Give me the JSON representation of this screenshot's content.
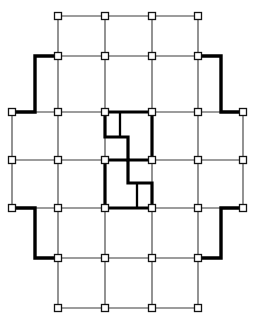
{
  "figure": {
    "type": "architectural-floor-plan",
    "background_color": "#ffffff",
    "line_color": "#3a3a3a",
    "wall_color": "#000000",
    "node_fill": "#ffffff"
  },
  "geometry": {
    "width": 255,
    "height": 326,
    "column_axes_x": [
      12,
      58,
      105,
      152,
      198,
      243
    ],
    "row_axes_y": [
      16,
      56,
      112,
      160,
      208,
      258,
      308
    ],
    "bay_count_x": 5,
    "bay_count_y": 6,
    "node_size": 7
  },
  "grid_lines": {
    "vertical": [
      {
        "id": "axis-A",
        "x": 12,
        "y1": 112,
        "y2": 208
      },
      {
        "id": "axis-B",
        "x": 58,
        "y1": 16,
        "y2": 308
      },
      {
        "id": "axis-C",
        "x": 105,
        "y1": 16,
        "y2": 308
      },
      {
        "id": "axis-D",
        "x": 152,
        "y1": 16,
        "y2": 308
      },
      {
        "id": "axis-E",
        "x": 198,
        "y1": 16,
        "y2": 308
      },
      {
        "id": "axis-F",
        "x": 243,
        "y1": 112,
        "y2": 208
      }
    ],
    "horizontal": [
      {
        "id": "axis-1",
        "y": 16,
        "x1": 58,
        "x2": 198
      },
      {
        "id": "axis-2",
        "y": 56,
        "x1": 58,
        "x2": 198
      },
      {
        "id": "axis-3",
        "y": 112,
        "x1": 12,
        "x2": 243
      },
      {
        "id": "axis-4",
        "y": 160,
        "x1": 12,
        "x2": 243
      },
      {
        "id": "axis-5",
        "y": 208,
        "x1": 12,
        "x2": 243
      },
      {
        "id": "axis-6",
        "y": 258,
        "x1": 58,
        "x2": 198
      },
      {
        "id": "axis-7",
        "y": 308,
        "x1": 58,
        "x2": 198
      }
    ]
  },
  "nodes": [
    {
      "x": 58,
      "y": 16
    },
    {
      "x": 105,
      "y": 16
    },
    {
      "x": 152,
      "y": 16
    },
    {
      "x": 198,
      "y": 16
    },
    {
      "x": 58,
      "y": 56
    },
    {
      "x": 105,
      "y": 56
    },
    {
      "x": 152,
      "y": 56
    },
    {
      "x": 198,
      "y": 56
    },
    {
      "x": 12,
      "y": 112
    },
    {
      "x": 58,
      "y": 112
    },
    {
      "x": 105,
      "y": 112
    },
    {
      "x": 152,
      "y": 112
    },
    {
      "x": 198,
      "y": 112
    },
    {
      "x": 243,
      "y": 112
    },
    {
      "x": 12,
      "y": 160
    },
    {
      "x": 58,
      "y": 160
    },
    {
      "x": 105,
      "y": 160
    },
    {
      "x": 152,
      "y": 160
    },
    {
      "x": 198,
      "y": 160
    },
    {
      "x": 243,
      "y": 160
    },
    {
      "x": 12,
      "y": 208
    },
    {
      "x": 58,
      "y": 208
    },
    {
      "x": 105,
      "y": 208
    },
    {
      "x": 152,
      "y": 208
    },
    {
      "x": 198,
      "y": 208
    },
    {
      "x": 243,
      "y": 208
    },
    {
      "x": 58,
      "y": 258
    },
    {
      "x": 105,
      "y": 258
    },
    {
      "x": 152,
      "y": 258
    },
    {
      "x": 198,
      "y": 258
    },
    {
      "x": 58,
      "y": 308
    },
    {
      "x": 105,
      "y": 308
    },
    {
      "x": 152,
      "y": 308
    },
    {
      "x": 198,
      "y": 308
    }
  ],
  "perimeter_outline": {
    "description": "Thick cruciform building envelope outline",
    "left_path": "M 58 56 L 35 56 L 35 112 L 12 112 M 12 208 L 35 208 L 35 258 L 58 258",
    "right_path": "M 198 56 L 221 56 L 221 112 L 243 112 M 243 208 L 221 208 L 221 258 L 198 258",
    "segments": [
      {
        "name": "top-left-stub",
        "x1": 58,
        "y1": 56,
        "x2": 35,
        "y2": 56
      },
      {
        "name": "upper-left-wall",
        "x1": 35,
        "y1": 56,
        "x2": 35,
        "y2": 112
      },
      {
        "name": "lower-left-wall",
        "x1": 35,
        "y1": 208,
        "x2": 35,
        "y2": 258
      },
      {
        "name": "bottom-left-stub",
        "x1": 35,
        "y1": 258,
        "x2": 58,
        "y2": 258
      },
      {
        "name": "top-right-stub",
        "x1": 198,
        "y1": 56,
        "x2": 221,
        "y2": 56
      },
      {
        "name": "upper-right-wall",
        "x1": 221,
        "y1": 56,
        "x2": 221,
        "y2": 112
      },
      {
        "name": "lower-right-wall",
        "x1": 221,
        "y1": 208,
        "x2": 221,
        "y2": 258
      },
      {
        "name": "bottom-right-stub",
        "x1": 221,
        "y1": 258,
        "x2": 198,
        "y2": 258
      }
    ]
  },
  "core": {
    "description": "Two point-symmetric S-shaped service core walls at plan centre",
    "upper_core_path": "M 105 112 L 152 112 L 152 160 L 128 160 L 128 137 L 105 137 L 105 112 Z",
    "upper_core_divider": "M 120 112 L 120 137",
    "lower_core_path": "M 152 208 L 105 208 L 105 160 L 128 160 L 128 183 L 152 183 L 152 208 Z",
    "lower_core_divider": "M 137 208 L 137 183",
    "centre_node": {
      "x": 152,
      "y": 160
    }
  },
  "legend": {
    "node_label": "column",
    "thick_label": "structural wall / envelope",
    "thin_label": "grid axis"
  }
}
